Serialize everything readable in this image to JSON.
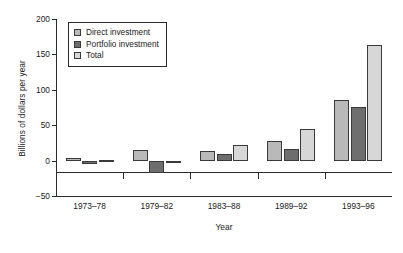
{
  "chart_data": {
    "type": "bar",
    "title": "",
    "xlabel": "Year",
    "ylabel": "Billions of dollars per year",
    "categories": [
      "1973–78",
      "1979–82",
      "1983–88",
      "1989–92",
      "1993–96"
    ],
    "series": [
      {
        "name": "Direct investment",
        "color": "#b9b9b9",
        "values": [
          4,
          15,
          13,
          27,
          86
        ]
      },
      {
        "name": "Portfolio investment",
        "color": "#6e6e6e",
        "values": [
          -5,
          -17,
          9,
          17,
          76
        ]
      },
      {
        "name": "Total",
        "color": "#d7d7d7",
        "values": [
          1,
          -3,
          22,
          44,
          163
        ]
      }
    ],
    "ylim": [
      -50,
      200
    ],
    "yticks": [
      200,
      150,
      100,
      50,
      0,
      -50
    ],
    "ytick_labels": [
      "200",
      "150",
      "100",
      "50",
      "0",
      "−50"
    ],
    "grid": false,
    "legend_position": "upper left"
  },
  "legend": {
    "items": [
      {
        "label": "Direct investment",
        "swatch": "direct"
      },
      {
        "label": "Portfolio investment",
        "swatch": "portfolio"
      },
      {
        "label": "Total",
        "swatch": "total"
      }
    ]
  }
}
